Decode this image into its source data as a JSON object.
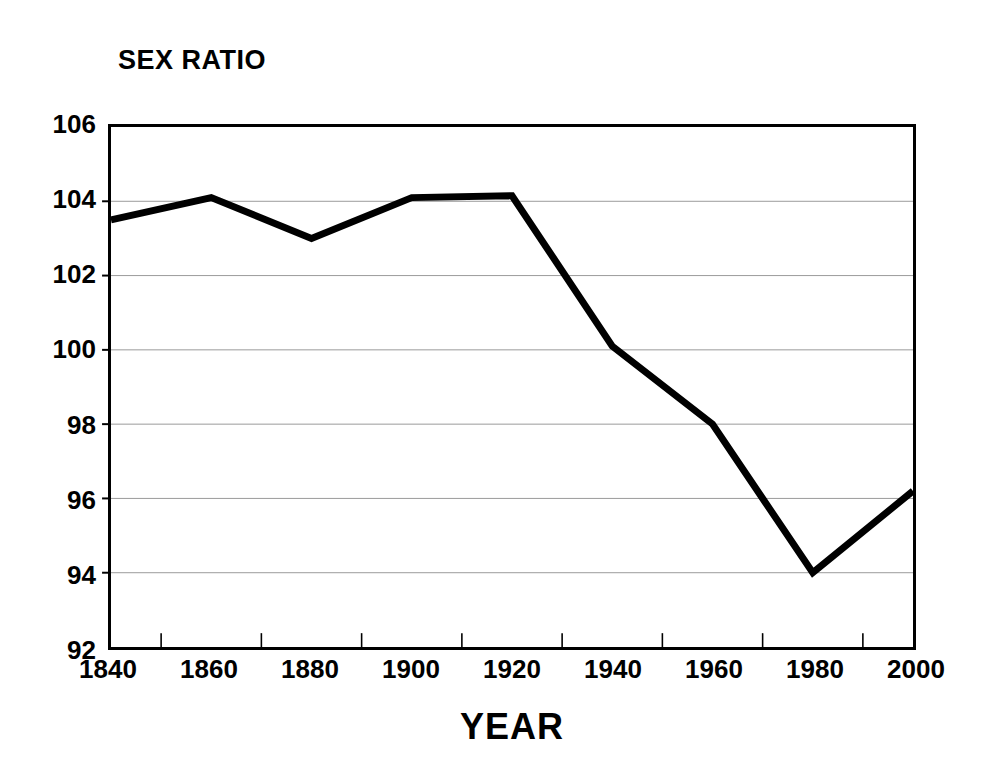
{
  "chart_data": {
    "type": "line",
    "title": "SEX RATIO",
    "xlabel": "YEAR",
    "ylabel": "SEX RATIO",
    "x": [
      1840,
      1860,
      1880,
      1900,
      1920,
      1940,
      1960,
      1980,
      2000
    ],
    "values": [
      103.5,
      104.1,
      103.0,
      104.1,
      104.15,
      100.1,
      98.0,
      94.0,
      96.2
    ],
    "series": [
      {
        "name": "Sex ratio",
        "values": [
          103.5,
          104.1,
          103.0,
          104.1,
          104.15,
          100.1,
          98.0,
          94.0,
          96.2
        ]
      }
    ],
    "categories": [
      "1840",
      "1860",
      "1880",
      "1900",
      "1920",
      "1940",
      "1960",
      "1980",
      "2000"
    ],
    "xlim": [
      1840,
      2000
    ],
    "ylim": [
      92,
      106
    ],
    "ytick_step": 2,
    "xtick_step": 20,
    "x_minor_tick_step": 10,
    "ytick_labels": [
      "106",
      "104",
      "102",
      "100",
      "98",
      "96",
      "94",
      "92"
    ],
    "xtick_labels": [
      "1840",
      "1860",
      "1880",
      "1900",
      "1920",
      "1940",
      "1960",
      "1980",
      "2000"
    ],
    "grid": true,
    "grid_axis": "y",
    "legend": false,
    "legend_position": "none",
    "markers": false,
    "line_color": "#000000",
    "line_width": 7,
    "grid_color": "#9a9a9a",
    "axis_color": "#000000",
    "background_color": "#ffffff"
  }
}
